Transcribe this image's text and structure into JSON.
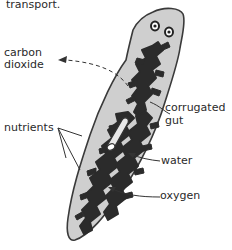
{
  "caption_fragment": "transport.",
  "diagram": {
    "labels": {
      "carbon_dioxide": [
        "carbon",
        "dioxide"
      ],
      "corrugated_gut": [
        "corrugated",
        "gut"
      ],
      "nutrients": "nutrients",
      "water": "water",
      "oxygen": "oxygen"
    },
    "colors": {
      "body_fill": "#cfcfcf",
      "body_outline": "#3a3a3a",
      "gut_fill": "#2b2b2b",
      "pharynx_fill": "#e8e8e8",
      "text": "#2a2a2a"
    }
  }
}
